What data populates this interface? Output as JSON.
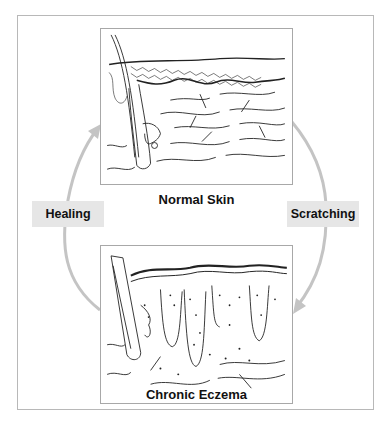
{
  "diagram": {
    "type": "cycle",
    "stages": [
      {
        "id": "normal",
        "label": "Normal Skin",
        "illustration": "cross-section of normal skin with hair follicle, thin epidermis and dermis fibers"
      },
      {
        "id": "eczema",
        "label": "Chronic Eczema",
        "illustration": "cross-section of thickened skin with elongated rete ridges, hair follicle and inflammatory cells"
      }
    ],
    "transitions": [
      {
        "from": "normal",
        "to": "eczema",
        "label": "Scratching",
        "side": "right"
      },
      {
        "from": "eczema",
        "to": "normal",
        "label": "Healing",
        "side": "left"
      }
    ],
    "colors": {
      "arrow": "#c4c4c4",
      "tag_background": "#e6e6e6",
      "frame_border": "#b8b8b8",
      "text": "#111111"
    }
  }
}
